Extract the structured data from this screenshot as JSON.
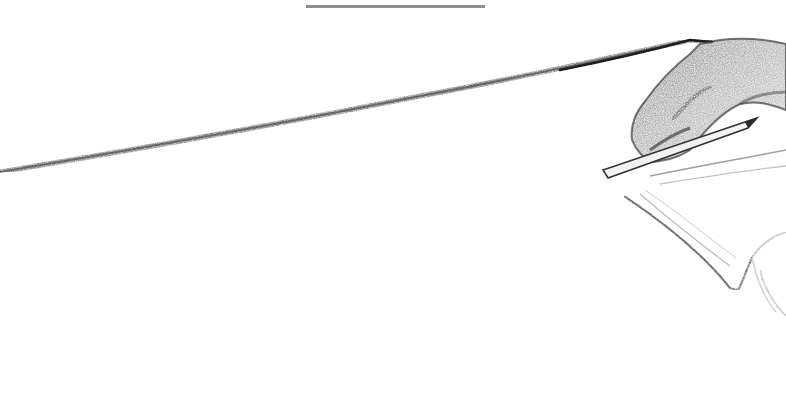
{
  "scene": {
    "description": "Pencil sketch of a hand holding a pencil, drawing a long line across the page",
    "background_color": "#ffffff",
    "top_bar_color": "#8e8e8e",
    "line_color": "#2b2b2b",
    "hand_shade_dark": "#3a3a3a",
    "hand_shade_mid": "#8a8a8a",
    "hand_shade_light": "#c8c8c8"
  }
}
